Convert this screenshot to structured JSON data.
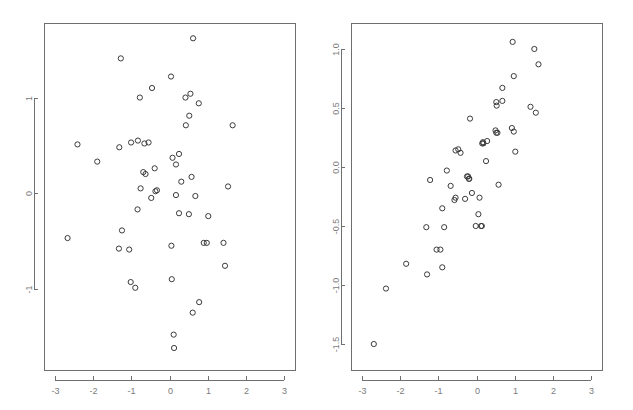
{
  "figure": {
    "background_color": "#ffffff",
    "panel_count": 2,
    "marker_style": "open-circle",
    "marker_color": "#3b3b3b",
    "axis_color": "#6f6f6f",
    "tick_label_color": "#7a7a7a"
  },
  "chart_data": [
    {
      "type": "scatter",
      "title": "",
      "subtitle": "",
      "xlabel": "",
      "ylabel": "",
      "xlim": [
        -3.3,
        3.3
      ],
      "ylim": [
        -1.85,
        1.78
      ],
      "xticks": [
        -3,
        -2,
        -1,
        0,
        1,
        2,
        3
      ],
      "xticklabels": [
        "-3",
        "-2",
        "-1",
        "0",
        "1",
        "2",
        "3"
      ],
      "yticks": [
        1,
        0,
        -1
      ],
      "yticklabels": [
        "1",
        "0",
        "-1"
      ],
      "grid": false,
      "legend": null,
      "annotations": [],
      "series": [
        {
          "name": "panel-1-points",
          "x": [
            0.62,
            -1.28,
            0.04,
            -0.46,
            -0.78,
            0.42,
            0.55,
            0.77,
            -2.42,
            -1.32,
            -1.01,
            -0.83,
            -0.66,
            -0.55,
            0.08,
            0.52,
            -1.9,
            0.25,
            0.17,
            -0.69,
            -0.63,
            -0.39,
            1.66,
            -0.76,
            0.43,
            0.31,
            -0.37,
            -0.33,
            1.54,
            0.17,
            0.58,
            -0.48,
            -0.84,
            0.25,
            0.68,
            -2.68,
            -1.25,
            0.9,
            0.98,
            1.42,
            -1.33,
            -1.06,
            0.05,
            1.46,
            -1.02,
            0.06,
            0.51,
            1.02,
            0.11,
            0.12,
            -0.9,
            0.61,
            0.78
          ],
          "y": [
            1.62,
            1.41,
            1.22,
            1.1,
            1.0,
            1.0,
            1.04,
            0.94,
            0.51,
            0.48,
            0.53,
            0.55,
            0.52,
            0.53,
            0.37,
            0.81,
            0.33,
            0.41,
            0.3,
            0.22,
            0.2,
            0.26,
            0.71,
            0.05,
            0.71,
            0.12,
            0.02,
            0.03,
            0.07,
            -0.02,
            0.17,
            -0.05,
            -0.17,
            -0.21,
            -0.03,
            -0.47,
            -0.39,
            -0.52,
            -0.52,
            -0.52,
            -0.58,
            -0.59,
            -0.55,
            -0.76,
            -0.93,
            -0.9,
            -0.22,
            -0.24,
            -1.48,
            -1.62,
            -0.99,
            -1.25,
            -1.14
          ]
        }
      ]
    },
    {
      "type": "scatter",
      "title": "",
      "subtitle": "",
      "xlabel": "",
      "ylabel": "",
      "xlim": [
        -3.3,
        3.3
      ],
      "ylim": [
        -1.72,
        1.22
      ],
      "xticks": [
        -3,
        -2,
        -1,
        0,
        1,
        2,
        3
      ],
      "xticklabels": [
        "-3",
        "-2",
        "-1",
        "0",
        "1",
        "2",
        "3"
      ],
      "yticks": [
        1.0,
        0.5,
        0.0,
        -0.5,
        -1.0,
        -1.5
      ],
      "yticklabels": [
        "1.0",
        "0.5",
        "0.0",
        "-0.5",
        "-1.0",
        "-1.5"
      ],
      "grid": false,
      "legend": null,
      "annotations": [],
      "series": [
        {
          "name": "panel-2-points",
          "x": [
            0.95,
            1.52,
            1.63,
            0.98,
            0.68,
            0.52,
            0.53,
            0.68,
            1.42,
            1.56,
            -0.17,
            0.5,
            0.52,
            0.55,
            0.93,
            0.98,
            0.15,
            0.17,
            0.18,
            1.02,
            -0.55,
            -0.48,
            0.28,
            -0.42,
            0.25,
            -0.78,
            -0.25,
            -0.22,
            -0.2,
            -0.19,
            0.58,
            -1.22,
            -0.68,
            -0.58,
            -0.55,
            -0.3,
            -0.12,
            0.08,
            0.05,
            -0.9,
            -0.02,
            -1.32,
            -0.85,
            0.12,
            0.14,
            -1.05,
            -0.95,
            -1.85,
            -1.3,
            -0.9,
            -2.38,
            -2.7
          ],
          "y": [
            1.06,
            1.0,
            0.87,
            0.77,
            0.67,
            0.55,
            0.52,
            0.56,
            0.51,
            0.46,
            0.41,
            0.31,
            0.29,
            0.29,
            0.33,
            0.3,
            0.2,
            0.21,
            0.2,
            0.13,
            0.14,
            0.15,
            0.22,
            0.12,
            0.05,
            -0.03,
            -0.08,
            -0.08,
            -0.1,
            -0.1,
            -0.15,
            -0.11,
            -0.16,
            -0.28,
            -0.26,
            -0.27,
            -0.22,
            -0.26,
            -0.4,
            -0.35,
            -0.5,
            -0.51,
            -0.51,
            -0.5,
            -0.5,
            -0.7,
            -0.7,
            -0.82,
            -0.91,
            -0.85,
            -1.03,
            -1.5
          ]
        }
      ]
    }
  ]
}
